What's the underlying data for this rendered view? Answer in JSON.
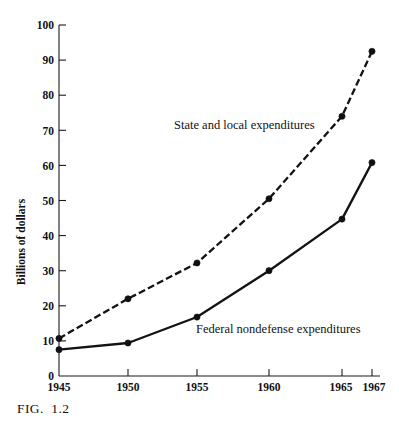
{
  "figure": {
    "caption": "FIG.  1.2"
  },
  "chart_data": {
    "type": "line",
    "title": "",
    "xlabel": "",
    "ylabel": "Billions of dollars",
    "x": [
      1945,
      1950,
      1955,
      1960,
      1965,
      1967
    ],
    "xtick_labels": [
      "1945",
      "1950",
      "1955",
      "1960",
      "1965",
      "1967"
    ],
    "ytick_labels": [
      "0",
      "10",
      "20",
      "30",
      "40",
      "50",
      "60",
      "70",
      "80",
      "90",
      "100"
    ],
    "ytick_values": [
      0,
      10,
      20,
      30,
      40,
      50,
      60,
      70,
      80,
      90,
      100
    ],
    "xlim": [
      1945,
      1967
    ],
    "ylim": [
      0,
      100
    ],
    "grid": false,
    "legend_position": "inline-annotations",
    "series": [
      {
        "name": "State and local expenditures",
        "style": "dashed",
        "label": "State and local expenditures",
        "values": [
          10.7,
          22.0,
          32.2,
          50.5,
          74.0,
          92.5
        ]
      },
      {
        "name": "Federal nondefense expenditures",
        "style": "solid",
        "label": "Federal nondefense expenditures",
        "values": [
          7.5,
          9.4,
          16.8,
          30.0,
          44.7,
          60.8
        ]
      }
    ],
    "annotations": [
      {
        "text": "State and local expenditures",
        "x": 1955.0,
        "y": 70.5
      },
      {
        "text": "Federal nondefense expenditures",
        "x": 1956.6,
        "y": 17.6
      }
    ]
  },
  "colors": {
    "ink": "#131313",
    "background": "#ffffff"
  }
}
